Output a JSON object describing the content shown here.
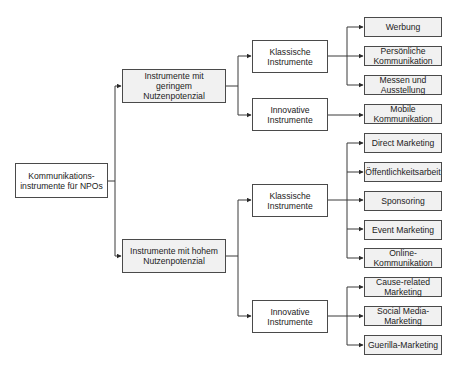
{
  "diagram": {
    "root": {
      "label": "Kommunikations-\ninstrumente für NPOs"
    },
    "level1": [
      {
        "label": "Instrumente mit geringem Nutzenpotenzial"
      },
      {
        "label": "Instrumente mit hohem Nutzenpotenzial"
      }
    ],
    "level2": [
      {
        "label": "Klassische Instrumente"
      },
      {
        "label": "Innovative Instrumente"
      },
      {
        "label": "Klassische Instrumente"
      },
      {
        "label": "Innovative Instrumente"
      }
    ],
    "leaves": [
      {
        "label": "Werbung"
      },
      {
        "label": "Persönliche Kommunikation"
      },
      {
        "label": "Messen und Ausstellung"
      },
      {
        "label": "Mobile Kommunikation"
      },
      {
        "label": "Direct Marketing"
      },
      {
        "label": "Öffentlichkeitsarbeit"
      },
      {
        "label": "Sponsoring"
      },
      {
        "label": "Event Marketing"
      },
      {
        "label": "Online-Kommunikation"
      },
      {
        "label": "Cause-related Marketing"
      },
      {
        "label": "Social Media-Marketing"
      },
      {
        "label": "Guerilla-Marketing"
      }
    ],
    "colors": {
      "line": "#3a3a3a",
      "leaf_fill": "#f1f1f1",
      "node_fill": "#ffffff",
      "border": "#4a4a4a"
    }
  }
}
